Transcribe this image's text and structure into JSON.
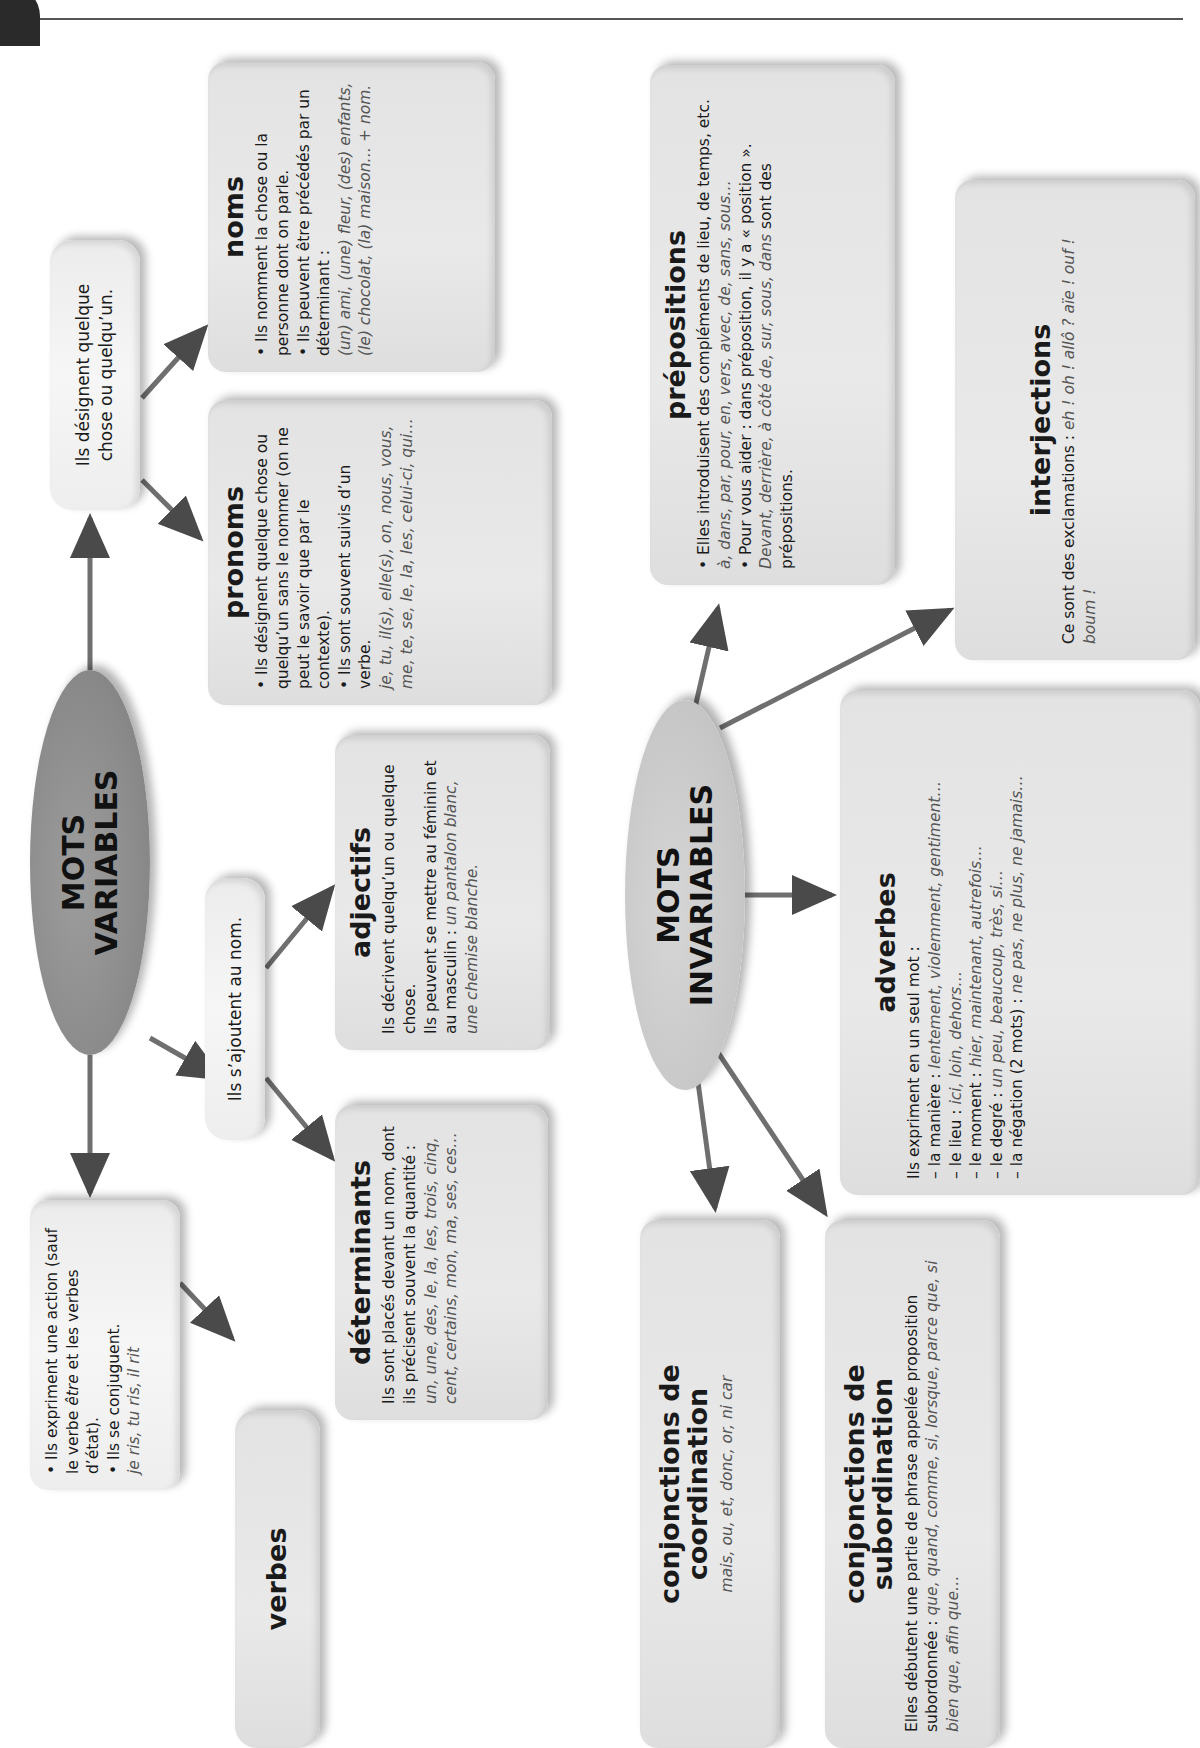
{
  "orientation": "rotated-90-ccw",
  "variables": {
    "hub": {
      "line1": "MOTS",
      "line2": "VARIABLES"
    },
    "designent": {
      "text": "Ils désignent quelque chose ou quelqu’un."
    },
    "ajoutent": {
      "text": "Ils s’ajoutent au nom."
    },
    "noms": {
      "title": "noms",
      "b1": "Ils nomment la chose ou la personne dont on parle.",
      "b2": "Ils peuvent être précédés par un déterminant :",
      "ex": "(un) ami, (une) fleur, (des) enfants, (le) chocolat, (la) maison… + nom."
    },
    "pronoms": {
      "title": "pronoms",
      "b1": "Ils désignent quelque chose ou quelqu’un sans le nommer (on ne peut le savoir que par le contexte).",
      "b2": "Ils sont souvent suivis d’un verbe.",
      "ex": "je, tu, il(s), elle(s), on, nous, vous, me, te, se, le, la, les, celui-ci, qui…"
    },
    "adjectifs": {
      "title": "adjectifs",
      "t1": "Ils décrivent quelqu’un ou quelque chose.",
      "t2": "Ils peuvent se mettre au féminin et au masculin :",
      "ex": "un pantalon blanc, une chemise blanche."
    },
    "determinants": {
      "title": "déterminants",
      "t1": "Ils sont placés devant un nom, dont ils précisent souvent la quantité :",
      "ex": "un, une, des, le, la, les, trois, cinq, cent, certains, mon, ma, ses, ces…"
    },
    "verbes_info": {
      "b1_a": "Ils expriment une action (sauf le verbe ",
      "b1_em": "être",
      "b1_b": " et les verbes d’état).",
      "b2": "Ils se conjuguent.",
      "ex": "je ris, tu ris, il rit"
    },
    "verbes": {
      "title": "verbes"
    }
  },
  "invariables": {
    "hub": {
      "line1": "MOTS",
      "line2": "INVARIABLES"
    },
    "prepositions": {
      "title": "prépositions",
      "b1": "Elles introduisent des compléments de lieu, de temps, etc.",
      "ex1": "à, dans, par, pour, en, vers, avec, de, sans, sous…",
      "b2": "Pour vous aider : dans préposition, il y a « position ».",
      "ex2": "Devant, derrière, à côté de, sur, sous, dans",
      "b2_end": " sont des prépositions."
    },
    "interjections": {
      "title": "interjections",
      "t1": "Ce sont des exclamations : ",
      "ex": "eh ! oh ! allô ? aïe ! ouf ! boum !"
    },
    "adverbes": {
      "title": "adverbes",
      "intro": "Ils expriment en un seul mot :",
      "items": [
        {
          "label": "– la manière : ",
          "ex": "lentement, violemment, gentiment…"
        },
        {
          "label": "– le lieu : ",
          "ex": "ici, loin, dehors…"
        },
        {
          "label": "– le moment : ",
          "ex": "hier, maintenant, autrefois…"
        },
        {
          "label": "– le degré : ",
          "ex": "un peu, beaucoup, très, si…"
        },
        {
          "label": "– la négation (2 mots) : ",
          "ex": "ne pas, ne plus, ne jamais…"
        }
      ]
    },
    "coordination": {
      "title_1": "conjonctions de",
      "title_2": "coordination",
      "ex": "mais, ou, et, donc, or, ni car"
    },
    "subordination": {
      "title_1": "conjonctions de",
      "title_2": "subordination",
      "t1": "Elles débutent une partie de phrase appelée proposition subordonnée :",
      "ex": "que, quand, comme, si, lorsque, parce que, si bien que, afin que…"
    }
  },
  "colors": {
    "box": "#e4e4e4",
    "hub_variables": "#8c8c8c",
    "hub_invariables": "#c6c6c6",
    "arrow": "#6a6a6a",
    "example_text": "#555555"
  }
}
